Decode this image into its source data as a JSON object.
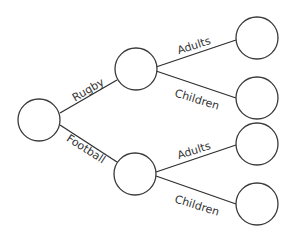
{
  "diagram": {
    "type": "tree",
    "colors": {
      "stroke": "#3a3a3a",
      "text": "#333333",
      "background": "#ffffff"
    },
    "nodes": [
      {
        "id": "root",
        "label": ""
      },
      {
        "id": "rugby",
        "label": ""
      },
      {
        "id": "football",
        "label": ""
      },
      {
        "id": "rugby-adults",
        "label": ""
      },
      {
        "id": "rugby-children",
        "label": ""
      },
      {
        "id": "football-adults",
        "label": ""
      },
      {
        "id": "football-children",
        "label": ""
      }
    ],
    "edges": [
      {
        "from": "root",
        "to": "rugby",
        "label": "Rugby"
      },
      {
        "from": "root",
        "to": "football",
        "label": "Football"
      },
      {
        "from": "rugby",
        "to": "rugby-adults",
        "label": "Adults"
      },
      {
        "from": "rugby",
        "to": "rugby-children",
        "label": "Children"
      },
      {
        "from": "football",
        "to": "football-adults",
        "label": "Adults"
      },
      {
        "from": "football",
        "to": "football-children",
        "label": "Children"
      }
    ]
  }
}
